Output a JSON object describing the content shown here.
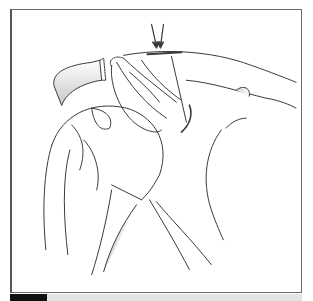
{
  "figure": {
    "arrows_count": 2,
    "colors": {
      "frame_border": "#6b6b6b",
      "line_art": "#3a3a3a",
      "shading": "#bdbdbd",
      "label_block": "#111111",
      "caption_bar": "#e4e4e4"
    }
  },
  "caption": {
    "label": "",
    "text": ""
  }
}
